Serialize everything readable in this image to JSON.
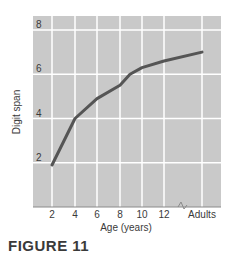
{
  "chart_data": {
    "type": "line",
    "title": "",
    "xlabel": "Age (years)",
    "ylabel": "Digit span",
    "x_tick_labels": [
      "2",
      "4",
      "6",
      "8",
      "10",
      "12",
      "Adults"
    ],
    "y_tick_labels": [
      "2",
      "4",
      "6",
      "8"
    ],
    "ylim": [
      0,
      8
    ],
    "grid": true,
    "axis_break": "between 12 and Adults",
    "series": [
      {
        "name": "Digit span",
        "x": [
          "2",
          "4",
          "6",
          "8",
          "9",
          "10",
          "12",
          "Adults"
        ],
        "values": [
          1.9,
          4.0,
          4.9,
          5.5,
          6.0,
          6.3,
          6.6,
          7.0
        ]
      }
    ]
  },
  "caption": "FIGURE 11",
  "colors": {
    "plot_background": "#c9c9c9",
    "grid": "#ffffff",
    "line": "#555555",
    "text": "#3a3a3a"
  }
}
